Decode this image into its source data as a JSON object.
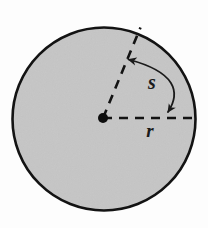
{
  "figure": {
    "kind": "geometry-diagram",
    "width": 208,
    "height": 228,
    "background_color": "#fdfdfd"
  },
  "circle": {
    "name": "shaded-circle",
    "center_x": 104,
    "center_y": 119,
    "radius": 92,
    "fill_color": "#c8c8c8",
    "stroke_color": "#131313",
    "stroke_width": 2.6
  },
  "center_point": {
    "name": "center-dot",
    "x": 103,
    "y": 118,
    "radius": 5,
    "color": "#0d0d0d"
  },
  "radii": [
    {
      "id": "horizontal-radius",
      "label": "r",
      "from_x": 103,
      "from_y": 118,
      "to_x": 196,
      "to_y": 118,
      "style": "dashed",
      "label_x": 150,
      "label_y": 137,
      "label_font_size": 19
    },
    {
      "id": "angled-radius",
      "label": "",
      "from_x": 103,
      "from_y": 118,
      "to_x": 140,
      "to_y": 28,
      "style": "dashed",
      "angle_degrees": 67.6
    }
  ],
  "arc_arrow": {
    "id": "arc-length-arrow",
    "label": "s",
    "label_x": 152,
    "label_y": 89,
    "label_font_size": 20,
    "start_x": 168,
    "start_y": 112,
    "end_x": 127,
    "end_y": 59,
    "control_x": 182,
    "control_y": 68,
    "stroke_color": "#1a1a1a",
    "stroke_width": 1.8,
    "arrowheads": "both"
  },
  "dash_pattern": {
    "dash": 9,
    "gap": 7,
    "stroke_width": 2.6,
    "color": "#131313"
  },
  "labels": {
    "arc_label": "s",
    "radius_label": "r"
  },
  "colors": {
    "fill": "#c8c8c8",
    "ink": "#131313",
    "page": "#fdfdfd"
  }
}
